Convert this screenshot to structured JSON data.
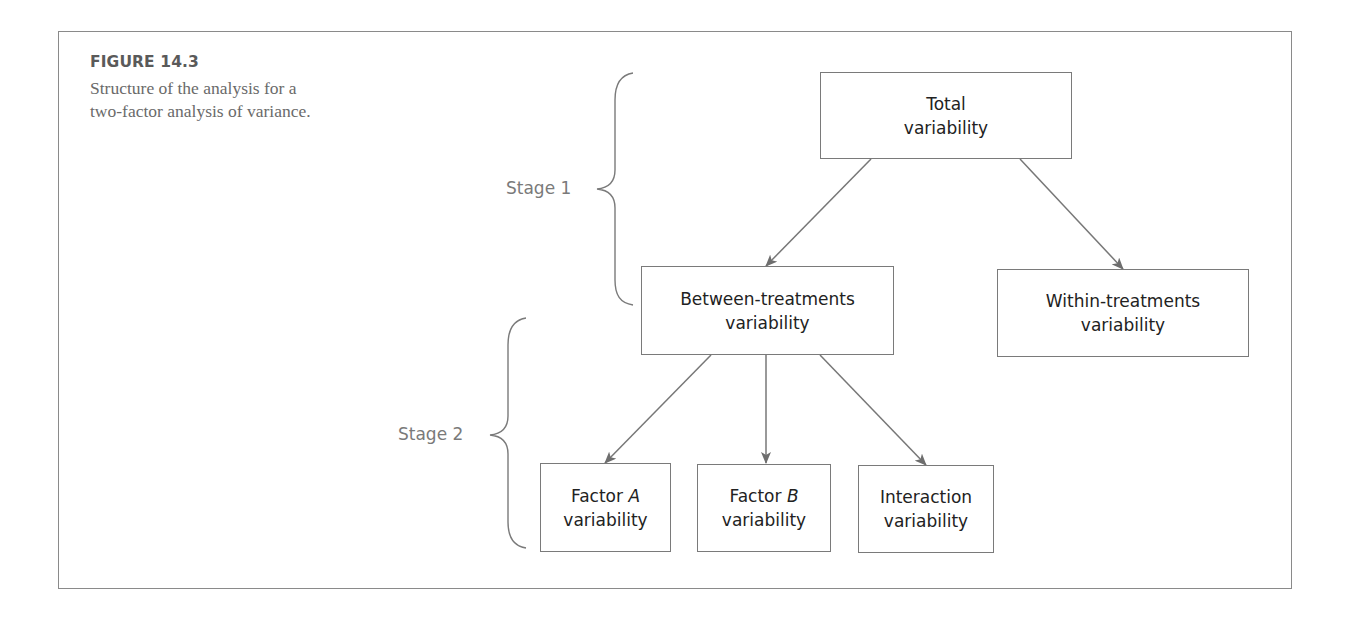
{
  "figure": {
    "label": "FIGURE 14.3",
    "caption": "Structure of the analysis for a two-factor analysis of variance."
  },
  "stages": [
    {
      "label": "Stage 1"
    },
    {
      "label": "Stage 2"
    }
  ],
  "nodes": {
    "total": {
      "line1": "Total",
      "line2": "variability"
    },
    "between": {
      "line1": "Between-treatments",
      "line2": "variability"
    },
    "within": {
      "line1": "Within-treatments",
      "line2": "variability"
    },
    "factor_a": {
      "line1_prefix": "Factor ",
      "line1_var": "A",
      "line2": "variability"
    },
    "factor_b": {
      "line1_prefix": "Factor ",
      "line1_var": "B",
      "line2": "variability"
    },
    "interaction": {
      "line1": "Interaction",
      "line2": "variability"
    }
  },
  "edges": [
    {
      "from": "total",
      "to": "between"
    },
    {
      "from": "total",
      "to": "within"
    },
    {
      "from": "between",
      "to": "factor_a"
    },
    {
      "from": "between",
      "to": "factor_b"
    },
    {
      "from": "between",
      "to": "interaction"
    }
  ],
  "colors": {
    "border": "#7a7a7a",
    "arrow": "#777777",
    "text": "#222222",
    "caption": "#6a6a6a",
    "stage_text": "#7a7a7a"
  }
}
